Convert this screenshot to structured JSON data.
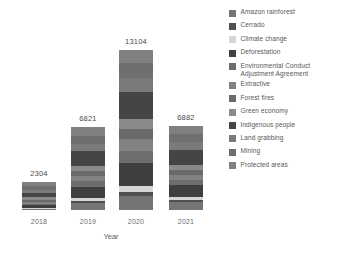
{
  "chart_data": {
    "type": "bar",
    "subtype": "stacked-bar",
    "title": "",
    "xlabel": "Year",
    "ylabel": "",
    "grid": false,
    "legend_position": "right",
    "ylim": [
      0,
      13104
    ],
    "categories": [
      "2018",
      "2019",
      "2020",
      "2021"
    ],
    "totals": [
      2304,
      6821,
      13104,
      6882
    ],
    "series": [
      {
        "name": "Amazon rainforest",
        "color": "#757575",
        "values": [
          60,
          540,
          1150,
          620
        ]
      },
      {
        "name": "Cerrado",
        "color": "#4f4f4f",
        "values": [
          45,
          170,
          320,
          180
        ]
      },
      {
        "name": "Climate change",
        "color": "#d6d6d6",
        "values": [
          70,
          260,
          520,
          260
        ]
      },
      {
        "name": "Deforestation",
        "color": "#3f3f3f",
        "values": [
          200,
          950,
          1880,
          960
        ]
      },
      {
        "name": "Environmental Conduct\nAdjustment Agreement",
        "color": "#6e6e6e",
        "values": [
          130,
          440,
          1000,
          430
        ]
      },
      {
        "name": "Extractive",
        "color": "#828282",
        "values": [
          190,
          420,
          950,
          410
        ]
      },
      {
        "name": "Forest fires",
        "color": "#6a6a6a",
        "values": [
          160,
          410,
          780,
          400
        ]
      },
      {
        "name": "Green economy",
        "color": "#8a8a8a",
        "values": [
          180,
          430,
          820,
          430
        ]
      },
      {
        "name": "Indigenous people",
        "color": "#454545",
        "values": [
          360,
          1180,
          2250,
          1210
        ]
      },
      {
        "name": "Land grabbing",
        "color": "#7a7a7a",
        "values": [
          260,
          620,
          1180,
          640
        ]
      },
      {
        "name": "Mining",
        "color": "#6f6f6f",
        "values": [
          290,
          660,
          1220,
          670
        ]
      },
      {
        "name": "Protected areas",
        "color": "#808080",
        "values": [
          359,
          741,
          1034,
          672
        ]
      }
    ]
  },
  "legend": {
    "items": [
      {
        "label": "Amazon rainforest",
        "color": "#757575"
      },
      {
        "label": "Cerrado",
        "color": "#4f4f4f"
      },
      {
        "label": "Climate change",
        "color": "#d6d6d6"
      },
      {
        "label": "Deforestation",
        "color": "#3f3f3f"
      },
      {
        "label": "Environmental Conduct\nAdjustment Agreement",
        "color": "#6e6e6e"
      },
      {
        "label": "Extractive",
        "color": "#828282"
      },
      {
        "label": "Forest fires",
        "color": "#6a6a6a"
      },
      {
        "label": "Green economy",
        "color": "#8a8a8a"
      },
      {
        "label": "Indigenous people",
        "color": "#454545"
      },
      {
        "label": "Land grabbing",
        "color": "#7a7a7a"
      },
      {
        "label": "Mining",
        "color": "#6f6f6f"
      },
      {
        "label": "Protected areas",
        "color": "#808080"
      }
    ]
  }
}
